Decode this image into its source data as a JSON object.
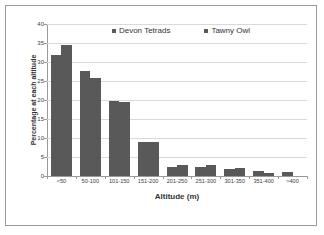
{
  "chart_data": {
    "type": "bar",
    "title": "",
    "xlabel": "Altitude (m)",
    "ylabel": "Percentage at each altitude",
    "categories": [
      "<50",
      "50-100",
      "101-150",
      "151-200",
      "201-250",
      "251-300",
      "301-350",
      "351-400",
      ">400"
    ],
    "series": [
      {
        "name": "Devon Tetrads",
        "color": "#595959",
        "values": [
          31.8,
          27.6,
          19.8,
          8.9,
          2.5,
          2.5,
          1.8,
          1.3,
          1.0
        ]
      },
      {
        "name": "Tawny Owl",
        "color": "#595959",
        "values": [
          34.6,
          25.9,
          19.5,
          8.9,
          3.0,
          2.8,
          2.1,
          0.9,
          0.0
        ]
      }
    ],
    "ylim": [
      0,
      40
    ],
    "y_ticks": [
      0,
      5,
      10,
      15,
      20,
      25,
      30,
      35,
      40
    ],
    "y_tick_labels": [
      "0",
      "5",
      "10",
      "15",
      "20",
      "25",
      "30",
      "35",
      "40"
    ],
    "grid": true,
    "legend_position": "top-center",
    "legend": [
      "Devon Tetrads",
      "Tawny Owl"
    ],
    "bar_color": "#595959",
    "gridline_color": "#d9d9d9",
    "axis_color": "#9a9a9a",
    "frame_color": "#9a9a9a"
  }
}
